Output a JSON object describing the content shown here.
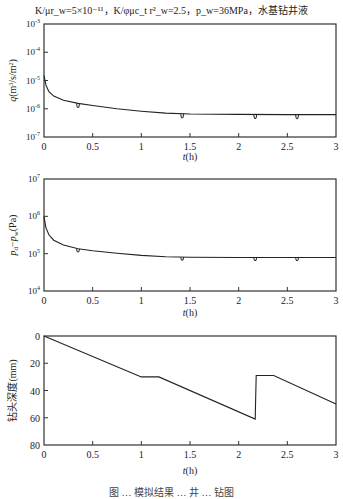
{
  "title": "K/μr_w=5×10⁻¹¹，K/φμc_t r²_w=2.5，p_w=36MPa，水基钻井液",
  "caption": "图 … 模拟结果 … 井 … 钻图",
  "chart_data": [
    {
      "type": "line",
      "title": "",
      "xlabel": "t(h)",
      "ylabel": "q(m³/s/m²)",
      "yscale": "log",
      "xlim": [
        0,
        3
      ],
      "ylim": [
        1e-07,
        0.001
      ],
      "xticks": [
        "0",
        "0.5",
        "1",
        "1.5",
        "2",
        "2.5",
        "3"
      ],
      "yticks": [
        "10⁻⁷",
        "10⁻⁶",
        "10⁻⁵",
        "10⁻⁴",
        "10⁻³"
      ],
      "grid": false,
      "series": [
        {
          "name": "q",
          "x": [
            0,
            0.02,
            0.05,
            0.1,
            0.2,
            0.35,
            0.5,
            0.75,
            1.0,
            1.25,
            1.5,
            2.0,
            2.5,
            3.0
          ],
          "y": [
            1.5e-05,
            7e-06,
            4e-06,
            2.8e-06,
            2e-06,
            1.55e-06,
            1.3e-06,
            1e-06,
            8.2e-07,
            7e-07,
            6.5e-07,
            6.3e-07,
            6.2e-07,
            6.2e-07
          ]
        }
      ],
      "annotations": [
        "small dips at t≈0.35, 1.42, 2.17, 2.6 h"
      ]
    },
    {
      "type": "line",
      "title": "",
      "xlabel": "t(h)",
      "ylabel": "p_d−p_w(Pa)",
      "yscale": "log",
      "xlim": [
        0,
        3
      ],
      "ylim": [
        10000.0,
        10000000.0
      ],
      "xticks": [
        "0",
        "0.5",
        "1",
        "1.5",
        "2",
        "2.5",
        "3"
      ],
      "yticks": [
        "10⁴",
        "10⁵",
        "10⁶",
        "10⁷"
      ],
      "grid": false,
      "series": [
        {
          "name": "p_d - p_w",
          "x": [
            0,
            0.02,
            0.05,
            0.1,
            0.2,
            0.35,
            0.5,
            0.75,
            1.0,
            1.25,
            1.5,
            2.0,
            2.5,
            3.0
          ],
          "y": [
            1000000.0,
            500000.0,
            320000.0,
            230000.0,
            170000.0,
            135000.0,
            120000.0,
            102000.0,
            90000.0,
            83000.0,
            80000.0,
            79000.0,
            79000.0,
            79000.0
          ]
        }
      ],
      "annotations": [
        "small dips at t≈0.35, 1.42, 2.17, 2.6 h"
      ]
    },
    {
      "type": "line",
      "title": "",
      "xlabel": "t(h)",
      "ylabel": "钻头深度(mm)",
      "yscale": "linear",
      "yinverted": true,
      "xlim": [
        0,
        3
      ],
      "ylim": [
        80,
        0
      ],
      "xticks": [
        "0",
        "0.5",
        "1",
        "1.5",
        "2",
        "2.5",
        "3"
      ],
      "yticks": [
        "0",
        "20",
        "40",
        "60",
        "80"
      ],
      "grid": false,
      "series": [
        {
          "name": "bit depth",
          "x": [
            0,
            1.0,
            1.18,
            2.17,
            2.18,
            2.36,
            3.0
          ],
          "y": [
            0,
            30,
            30,
            61,
            29,
            29,
            50
          ]
        }
      ]
    }
  ],
  "plots": [
    {
      "ylabel": "q (m³/s/m²)",
      "xlabel": "t(h)",
      "yticks": [
        "10⁻³",
        "10⁻⁴",
        "10⁻⁵",
        "10⁻⁶",
        "10⁻⁷"
      ],
      "xticks": [
        "0",
        "0.5",
        "1",
        "1.5",
        "2",
        "2.5",
        "3"
      ]
    },
    {
      "ylabel": "p_d−p_w (Pa)",
      "xlabel": "t(h)",
      "yticks": [
        "10⁷",
        "10⁶",
        "10⁵",
        "10⁴"
      ],
      "xticks": [
        "0",
        "0.5",
        "1",
        "1.5",
        "2",
        "2.5",
        "3"
      ]
    },
    {
      "ylabel": "钻头深度(mm)",
      "xlabel": "t(h)",
      "yticks": [
        "0",
        "20",
        "40",
        "60",
        "80"
      ],
      "xticks": [
        "0",
        "0.5",
        "1",
        "1.5",
        "2",
        "2.5",
        "3"
      ]
    }
  ]
}
